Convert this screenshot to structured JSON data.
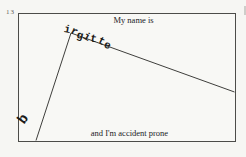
{
  "page": {
    "page_number": "13",
    "background_color": "#f6f6f3"
  },
  "cartoon": {
    "tag_top_text": "My name is",
    "fallen_name": "irgitte",
    "fallen_letter": "b",
    "caption": "and I'm accident prone",
    "ink_color": "#1c1c1a",
    "line_color": "#3f3f3c"
  }
}
